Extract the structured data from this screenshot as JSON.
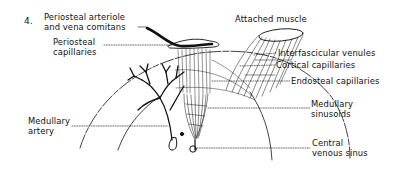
{
  "figure_number": "4.",
  "labels": {
    "periosteal_arteriole": [
      "Periosteal arteriole",
      "and vena comitans"
    ],
    "periosteal_capillaries": [
      "Periosteal",
      "capillaries"
    ],
    "attached_muscle": "Attached muscle",
    "interfascicular_venules": "Interfascicular venules",
    "cortical_capillaries": "Cortical capillaries",
    "endosteal_capillaries": "Endosteal capillaries",
    "medullary_sinusoids": [
      "Medullary",
      "sinusoids"
    ],
    "medullary_artery": [
      "Medullary",
      "artery"
    ],
    "central_venous_sinus": [
      "Central",
      "venous sinus"
    ]
  },
  "colors": {
    "ink": "#111111",
    "background": "#ffffff"
  }
}
